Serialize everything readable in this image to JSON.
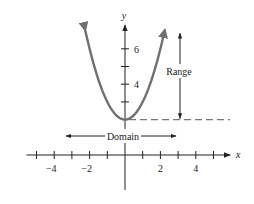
{
  "chart_data": {
    "type": "line",
    "title": "",
    "function": "y = x^2 + 2",
    "xlabel": "x",
    "ylabel": "y",
    "xlim": [
      -5.5,
      6
    ],
    "ylim": [
      -4.5,
      8
    ],
    "x_ticks": [
      -5,
      -4,
      -3,
      -2,
      -1,
      1,
      2,
      3,
      4,
      5
    ],
    "x_tick_labels": [
      {
        "value": -4,
        "label": "−4"
      },
      {
        "value": -2,
        "label": "−2"
      },
      {
        "value": 2,
        "label": "2"
      },
      {
        "value": 4,
        "label": "4"
      }
    ],
    "y_ticks": [
      3,
      4,
      5,
      6
    ],
    "y_tick_labels": [
      {
        "value": 4,
        "label": "4"
      },
      {
        "value": 6,
        "label": "6"
      }
    ],
    "curve_x_range": [
      -2.25,
      2.25
    ],
    "vertex": [
      0,
      2
    ],
    "annotations": {
      "range": {
        "label": "Range",
        "x": 3,
        "y_from": 2,
        "y_to": 7
      },
      "domain": {
        "label": "Domain",
        "x_from": -3.3,
        "x_to": 3,
        "y": 1
      },
      "dashed_line": {
        "y": 2,
        "x_from": 0,
        "x_to": 6
      }
    },
    "colors": {
      "curve": "#707070",
      "axes": "#222222"
    }
  }
}
